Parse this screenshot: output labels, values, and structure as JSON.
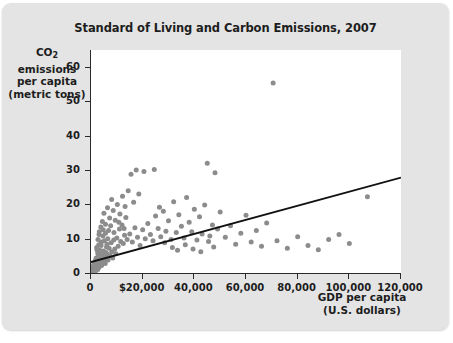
{
  "chart_data": {
    "type": "scatter",
    "title": "Standard of Living and Carbon Emissions, 2007",
    "xlabel_line1": "GDP per capita",
    "xlabel_line2": "(U.S. dollars)",
    "ylabel_line1_pre": "CO",
    "ylabel_line1_sub": "2",
    "ylabel_line1_post": " emissions",
    "ylabel_line2": "per capita",
    "ylabel_line3": "(metric tons)",
    "xlim": [
      0,
      120000
    ],
    "ylim": [
      0,
      65
    ],
    "grid": false,
    "legend": "none",
    "xticks": [
      0,
      20000,
      40000,
      60000,
      80000,
      100000,
      120000
    ],
    "xtick_labels": [
      "0",
      "$20,000",
      "40,000",
      "60,000",
      "80,000",
      "100,000",
      "120,000"
    ],
    "yticks": [
      0,
      10,
      20,
      30,
      40,
      50,
      60
    ],
    "ytick_labels": [
      "0",
      "10",
      "20",
      "30",
      "40",
      "50",
      "60"
    ],
    "point_color": "#8c8c8c",
    "point_radius": 2.5,
    "trendline": {
      "name": "linear regression",
      "color": "#111111",
      "width": 1.8,
      "x_start": 0,
      "y_start": 3.2,
      "x_end": 120000,
      "y_end": 27.8
    },
    "series": [
      {
        "name": "Countries",
        "points": [
          [
            600,
            0.2
          ],
          [
            700,
            0.3
          ],
          [
            800,
            0.1
          ],
          [
            900,
            0.4
          ],
          [
            1000,
            0.3
          ],
          [
            1100,
            0.6
          ],
          [
            1200,
            0.2
          ],
          [
            1300,
            0.8
          ],
          [
            1400,
            0.5
          ],
          [
            1500,
            1.0
          ],
          [
            700,
            1.2
          ],
          [
            850,
            0.9
          ],
          [
            1000,
            1.5
          ],
          [
            1150,
            0.7
          ],
          [
            1250,
            1.3
          ],
          [
            1600,
            0.6
          ],
          [
            1700,
            1.1
          ],
          [
            1800,
            0.9
          ],
          [
            1900,
            1.6
          ],
          [
            2000,
            1.2
          ],
          [
            2100,
            2.0
          ],
          [
            2200,
            1.4
          ],
          [
            2400,
            2.4
          ],
          [
            2500,
            1.8
          ],
          [
            2600,
            1.0
          ],
          [
            2800,
            2.2
          ],
          [
            3000,
            1.6
          ],
          [
            3100,
            2.8
          ],
          [
            3300,
            2.0
          ],
          [
            3500,
            3.1
          ],
          [
            500,
            0.2
          ],
          [
            600,
            0.5
          ],
          [
            750,
            0.3
          ],
          [
            950,
            0.2
          ],
          [
            1050,
            0.4
          ],
          [
            1250,
            0.3
          ],
          [
            1350,
            0.7
          ],
          [
            1450,
            0.4
          ],
          [
            1550,
            0.9
          ],
          [
            1650,
            0.5
          ],
          [
            3700,
            2.6
          ],
          [
            3900,
            3.6
          ],
          [
            4100,
            2.2
          ],
          [
            4300,
            4.0
          ],
          [
            4500,
            3.0
          ],
          [
            4800,
            5.2
          ],
          [
            5000,
            3.4
          ],
          [
            5200,
            4.6
          ],
          [
            5500,
            2.8
          ],
          [
            5800,
            6.0
          ],
          [
            6000,
            4.2
          ],
          [
            6300,
            5.5
          ],
          [
            6600,
            3.8
          ],
          [
            7000,
            7.2
          ],
          [
            7400,
            5.0
          ],
          [
            7800,
            8.8
          ],
          [
            8000,
            6.2
          ],
          [
            8400,
            4.4
          ],
          [
            8800,
            9.6
          ],
          [
            9200,
            7.0
          ],
          [
            2200,
            7.4
          ],
          [
            2600,
            5.8
          ],
          [
            3000,
            8.2
          ],
          [
            3400,
            6.6
          ],
          [
            4000,
            9.0
          ],
          [
            4600,
            10.8
          ],
          [
            5200,
            9.4
          ],
          [
            5600,
            11.6
          ],
          [
            6200,
            8.4
          ],
          [
            6800,
            12.4
          ],
          [
            9600,
            5.6
          ],
          [
            10000,
            10.2
          ],
          [
            10500,
            7.8
          ],
          [
            11000,
            12.8
          ],
          [
            11500,
            9.2
          ],
          [
            12000,
            14.0
          ],
          [
            12500,
            8.6
          ],
          [
            13000,
            11.0
          ],
          [
            13500,
            16.2
          ],
          [
            14000,
            9.8
          ],
          [
            3200,
            12.0
          ],
          [
            3800,
            13.4
          ],
          [
            4400,
            15.0
          ],
          [
            5000,
            17.4
          ],
          [
            5600,
            14.2
          ],
          [
            6400,
            19.0
          ],
          [
            7200,
            16.0
          ],
          [
            8000,
            21.4
          ],
          [
            8600,
            18.2
          ],
          [
            9400,
            15.4
          ],
          [
            10200,
            20.0
          ],
          [
            11200,
            17.2
          ],
          [
            12200,
            22.4
          ],
          [
            13200,
            19.4
          ],
          [
            14400,
            24.0
          ],
          [
            15000,
            11.4
          ],
          [
            16000,
            9.0
          ],
          [
            17000,
            13.2
          ],
          [
            18000,
            10.4
          ],
          [
            19000,
            8.0
          ],
          [
            15500,
            28.8
          ],
          [
            17500,
            30.0
          ],
          [
            20500,
            29.6
          ],
          [
            16500,
            20.6
          ],
          [
            18500,
            23.0
          ],
          [
            20000,
            12.6
          ],
          [
            21000,
            10.0
          ],
          [
            22000,
            14.4
          ],
          [
            23000,
            11.2
          ],
          [
            24000,
            9.4
          ],
          [
            25000,
            16.6
          ],
          [
            26000,
            13.0
          ],
          [
            27000,
            10.6
          ],
          [
            28000,
            18.0
          ],
          [
            29000,
            12.2
          ],
          [
            30000,
            15.2
          ],
          [
            31000,
            9.8
          ],
          [
            32000,
            20.8
          ],
          [
            33000,
            11.8
          ],
          [
            34000,
            17.0
          ],
          [
            35000,
            13.6
          ],
          [
            36000,
            10.2
          ],
          [
            37000,
            22.0
          ],
          [
            38000,
            14.8
          ],
          [
            39000,
            12.0
          ],
          [
            40000,
            18.6
          ],
          [
            41000,
            9.6
          ],
          [
            42000,
            16.4
          ],
          [
            43000,
            11.4
          ],
          [
            44000,
            19.8
          ],
          [
            45000,
            32.0
          ],
          [
            46000,
            10.8
          ],
          [
            47000,
            14.0
          ],
          [
            48000,
            29.2
          ],
          [
            49000,
            12.8
          ],
          [
            24500,
            30.2
          ],
          [
            26500,
            19.2
          ],
          [
            28500,
            8.8
          ],
          [
            31500,
            7.4
          ],
          [
            33500,
            6.6
          ],
          [
            36500,
            8.2
          ],
          [
            39500,
            7.0
          ],
          [
            42500,
            6.2
          ],
          [
            45500,
            9.2
          ],
          [
            47500,
            7.6
          ],
          [
            50000,
            17.8
          ],
          [
            52000,
            10.4
          ],
          [
            54000,
            13.8
          ],
          [
            56000,
            8.4
          ],
          [
            58000,
            11.6
          ],
          [
            60000,
            16.8
          ],
          [
            62000,
            9.0
          ],
          [
            64000,
            12.4
          ],
          [
            66000,
            7.8
          ],
          [
            68000,
            14.6
          ],
          [
            70500,
            55.4
          ],
          [
            72000,
            9.4
          ],
          [
            76000,
            7.2
          ],
          [
            80000,
            10.6
          ],
          [
            84000,
            8.0
          ],
          [
            88000,
            6.8
          ],
          [
            92000,
            9.8
          ],
          [
            96000,
            11.2
          ],
          [
            100000,
            8.6
          ],
          [
            107000,
            22.2
          ],
          [
            1800,
            3.8
          ],
          [
            2000,
            4.4
          ],
          [
            2400,
            3.2
          ],
          [
            2800,
            4.8
          ],
          [
            3200,
            3.4
          ],
          [
            3600,
            5.4
          ],
          [
            4200,
            4.0
          ],
          [
            4800,
            6.4
          ],
          [
            5400,
            4.8
          ],
          [
            6000,
            7.6
          ],
          [
            900,
            2.0
          ],
          [
            1100,
            2.6
          ],
          [
            1300,
            1.9
          ],
          [
            1500,
            3.0
          ],
          [
            1700,
            2.2
          ],
          [
            2300,
            6.8
          ],
          [
            2700,
            9.8
          ],
          [
            3100,
            11.2
          ],
          [
            3900,
            8.0
          ],
          [
            4700,
            12.6
          ],
          [
            6500,
            10.0
          ],
          [
            7600,
            13.8
          ],
          [
            8900,
            11.8
          ],
          [
            10800,
            14.8
          ],
          [
            12800,
            13.0
          ],
          [
            400,
            0.1
          ],
          [
            550,
            0.3
          ],
          [
            650,
            0.15
          ],
          [
            1150,
            1.8
          ],
          [
            1950,
            2.9
          ]
        ]
      }
    ]
  }
}
